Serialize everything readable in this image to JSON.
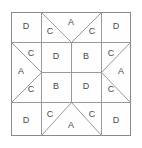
{
  "diagram": {
    "kind": "variable-star-quilt-block",
    "frame": {
      "x": 11,
      "y": 12,
      "width": 120,
      "height": 124,
      "border_color": "#8a8a8a",
      "line_color": "#9a9a9a",
      "background_color": "#ffffff",
      "label_color": "#4a4a4a"
    },
    "grid": {
      "columns": [
        11,
        41,
        101,
        131
      ],
      "rows": [
        12,
        42,
        102,
        136
      ],
      "center_split_x": 71,
      "center_split_y": 72
    },
    "patches": [
      {
        "id": "top-left-corner",
        "label": "D",
        "lx": 26,
        "ly": 27
      },
      {
        "id": "top-middle-left",
        "label": "C",
        "lx": 50,
        "ly": 32
      },
      {
        "id": "top-middle-center",
        "label": "A",
        "lx": 71,
        "ly": 23
      },
      {
        "id": "top-middle-right",
        "label": "C",
        "lx": 92,
        "ly": 32
      },
      {
        "id": "top-right-corner",
        "label": "D",
        "lx": 116,
        "ly": 27
      },
      {
        "id": "left-middle-top",
        "label": "C",
        "lx": 31,
        "ly": 54
      },
      {
        "id": "left-middle-center",
        "label": "A",
        "lx": 21,
        "ly": 72
      },
      {
        "id": "left-middle-bottom",
        "label": "C",
        "lx": 31,
        "ly": 90
      },
      {
        "id": "center-top-left",
        "label": "D",
        "lx": 56,
        "ly": 57
      },
      {
        "id": "center-top-right",
        "label": "B",
        "lx": 86,
        "ly": 57
      },
      {
        "id": "center-bottom-left",
        "label": "B",
        "lx": 56,
        "ly": 87
      },
      {
        "id": "center-bottom-right",
        "label": "D",
        "lx": 86,
        "ly": 87
      },
      {
        "id": "right-middle-top",
        "label": "C",
        "lx": 111,
        "ly": 54
      },
      {
        "id": "right-middle-center",
        "label": "A",
        "lx": 121,
        "ly": 72
      },
      {
        "id": "right-middle-bottom",
        "label": "C",
        "lx": 111,
        "ly": 90
      },
      {
        "id": "bottom-left-corner",
        "label": "D",
        "lx": 26,
        "ly": 121
      },
      {
        "id": "bottom-middle-left",
        "label": "C",
        "lx": 50,
        "ly": 115
      },
      {
        "id": "bottom-middle-center",
        "label": "A",
        "lx": 71,
        "ly": 126
      },
      {
        "id": "bottom-middle-right",
        "label": "C",
        "lx": 92,
        "ly": 115
      },
      {
        "id": "bottom-right-corner",
        "label": "D",
        "lx": 116,
        "ly": 121
      }
    ]
  }
}
